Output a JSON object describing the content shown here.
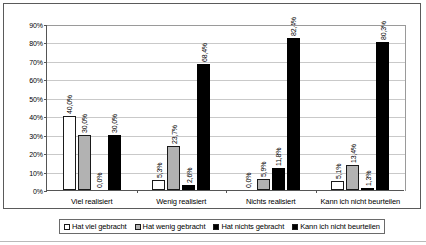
{
  "chart_data": {
    "type": "bar",
    "title": "",
    "subtitle": "",
    "xlabel": "",
    "ylabel": "",
    "ylim": [
      0,
      90
    ],
    "ytick_labels": [
      "0%",
      "10%",
      "20%",
      "30%",
      "40%",
      "50%",
      "60%",
      "70%",
      "80%",
      "90%"
    ],
    "ytick_values": [
      0,
      10,
      20,
      30,
      40,
      50,
      60,
      70,
      80,
      90
    ],
    "grid": true,
    "legend_position": "bottom",
    "categories": [
      "Viel realisiert",
      "Wenig realisiert",
      "Nichts realisiert",
      "Kann ich nicht beurteilen"
    ],
    "series": [
      {
        "name": "Hat viel gebracht",
        "color": "#ffffff",
        "values": [
          40.0,
          5.3,
          0.0,
          5.1
        ],
        "labels": [
          "40,0%",
          "5,3%",
          "0,0%",
          "5,1%"
        ]
      },
      {
        "name": "Hat wenig gebracht",
        "color": "#b2b2b2",
        "values": [
          30.0,
          23.7,
          5.9,
          13.4
        ],
        "labels": [
          "30,0%",
          "23,7%",
          "5,9%",
          "13,4%"
        ]
      },
      {
        "name": "Hat nichts gebracht",
        "color": "#000000",
        "values": [
          0.0,
          2.6,
          11.8,
          1.3
        ],
        "labels": [
          "0,0%",
          "2,6%",
          "11,8%",
          "1,3%"
        ]
      },
      {
        "name": "Kann ich nicht beurteilen",
        "color": "#000000",
        "values": [
          30.0,
          68.4,
          82.4,
          80.3
        ],
        "labels": [
          "30,0%",
          "68,4%",
          "82,4%",
          "80,3%"
        ]
      }
    ]
  }
}
